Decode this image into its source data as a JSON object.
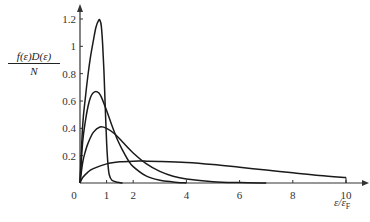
{
  "chart_data": {
    "type": "line",
    "title": "",
    "xlabel": "ε/εF",
    "xlabel_main": "ε/ε",
    "xlabel_sub": "F",
    "ylabel": "f(ε)D(ε)/N",
    "ylabel_numerator": "f(ε)D(ε)",
    "ylabel_denominator": "N",
    "xlim": [
      0,
      10
    ],
    "ylim": [
      0,
      1.2
    ],
    "grid": false,
    "legend": null,
    "x_ticks": [
      0,
      1,
      2,
      4,
      6,
      8,
      10
    ],
    "x_tick_labels": [
      "0",
      "1",
      "2",
      "4",
      "6",
      "8",
      "10"
    ],
    "y_ticks": [
      0.2,
      0.4,
      0.6,
      0.8,
      1,
      1.2
    ],
    "y_tick_labels": [
      "0.2",
      "0.4",
      "0.6",
      "0.8",
      "1",
      "1.2"
    ],
    "series": [
      {
        "name": "curve-1 (lowest temperature, sharp peak)",
        "x": [
          0,
          0.1,
          0.2,
          0.3,
          0.4,
          0.5,
          0.6,
          0.7,
          0.75,
          0.8,
          0.85,
          0.9,
          0.95,
          1.0,
          1.05,
          1.1,
          1.2,
          1.4,
          1.6
        ],
        "y": [
          0,
          0.42,
          0.62,
          0.79,
          0.93,
          1.04,
          1.14,
          1.19,
          1.19,
          1.15,
          1.02,
          0.82,
          0.55,
          0.3,
          0.14,
          0.06,
          0.02,
          0.005,
          0
        ]
      },
      {
        "name": "curve-2",
        "x": [
          0,
          0.1,
          0.2,
          0.3,
          0.4,
          0.5,
          0.6,
          0.7,
          0.8,
          1.0,
          1.2,
          1.4,
          1.6,
          1.8,
          2.0,
          2.5,
          3.0,
          3.5,
          4.0
        ],
        "y": [
          0,
          0.3,
          0.45,
          0.56,
          0.63,
          0.66,
          0.67,
          0.66,
          0.63,
          0.53,
          0.42,
          0.32,
          0.24,
          0.17,
          0.12,
          0.05,
          0.02,
          0.008,
          0
        ]
      },
      {
        "name": "curve-3",
        "x": [
          0,
          0.1,
          0.2,
          0.3,
          0.5,
          0.75,
          1.0,
          1.3,
          1.6,
          2.0,
          2.5,
          3.0,
          3.5,
          4.0,
          5.0,
          6.0,
          7.0
        ],
        "y": [
          0,
          0.15,
          0.23,
          0.29,
          0.37,
          0.41,
          0.4,
          0.36,
          0.3,
          0.22,
          0.14,
          0.085,
          0.05,
          0.03,
          0.01,
          0.003,
          0
        ]
      },
      {
        "name": "curve-4 (highest temperature, broad)",
        "x": [
          0,
          0.1,
          0.3,
          0.5,
          1.0,
          1.5,
          2.0,
          2.5,
          3.0,
          4.0,
          5.0,
          6.0,
          7.0,
          8.0,
          9.0,
          10.0
        ],
        "y": [
          0,
          0.04,
          0.08,
          0.105,
          0.14,
          0.155,
          0.16,
          0.16,
          0.158,
          0.15,
          0.135,
          0.115,
          0.095,
          0.075,
          0.055,
          0.04
        ]
      }
    ],
    "annotations": []
  },
  "style": {
    "line_color": "#1a1a1a",
    "axis_color": "#333333",
    "background": "#ffffff"
  }
}
